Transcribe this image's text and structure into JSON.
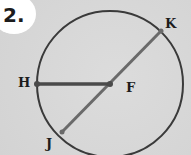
{
  "problem": {
    "number": "2."
  },
  "diagram": {
    "circle": {
      "center": "F",
      "cx": 110,
      "cy": 84,
      "r": 73
    },
    "points": {
      "H": {
        "label": "H",
        "x": 37,
        "y": 84
      },
      "F": {
        "label": "F",
        "x": 110,
        "y": 84
      },
      "K": {
        "label": "K",
        "x": 161,
        "y": 31
      },
      "J": {
        "label": "J",
        "x": 62,
        "y": 132
      }
    },
    "segments": [
      {
        "from": "H",
        "to": "F",
        "type": "radius"
      },
      {
        "from": "J",
        "to": "K",
        "type": "diameter"
      }
    ]
  },
  "colors": {
    "circle": "#3a3a3a",
    "radius": "#4a4a4a",
    "diameter": "#6a6a6a",
    "text": "#1c1c1c",
    "background": "#d6d6d6",
    "badge": "#ffffff"
  }
}
